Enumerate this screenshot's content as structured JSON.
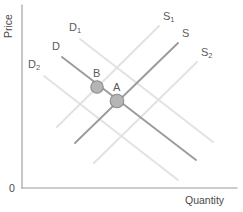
{
  "figure": {
    "background_color": "#ffffff"
  },
  "axes": {
    "y_axis_label": "Price",
    "x_axis_label": "Quantity",
    "origin_label": "0",
    "axis_color": "#9a9a9a",
    "ticks": [],
    "gridlines": false
  },
  "colors": {
    "primary_curve": "#9b9b9b",
    "shifted_curve": "#e2e2e2",
    "marker_fill": "#b5b5b5",
    "marker_stroke": "#8c8c8c",
    "label_text": "#5b5b5b",
    "axis_text": "#4a4a4a"
  },
  "curves": [
    {
      "id": "demand-original",
      "label_base": "D",
      "label_sub": "",
      "kind": "demand",
      "emphasis": "primary",
      "label_x": 52,
      "label_y": 50,
      "x1": 62,
      "y1": 57,
      "x2": 196,
      "y2": 160
    },
    {
      "id": "demand-shift-right",
      "label_base": "D",
      "label_sub": "1",
      "kind": "demand",
      "emphasis": "shifted",
      "label_x": 69,
      "label_y": 31,
      "x1": 80,
      "y1": 39,
      "x2": 213,
      "y2": 142
    },
    {
      "id": "demand-shift-left",
      "label_base": "D",
      "label_sub": "2",
      "kind": "demand",
      "emphasis": "shifted",
      "label_x": 28,
      "label_y": 68,
      "x1": 44,
      "y1": 76,
      "x2": 178,
      "y2": 180
    },
    {
      "id": "supply-original",
      "label_base": "S",
      "label_sub": "",
      "kind": "supply",
      "emphasis": "primary",
      "label_x": 182,
      "label_y": 37,
      "x1": 75,
      "y1": 143,
      "x2": 178,
      "y2": 43
    },
    {
      "id": "supply-shift-left",
      "label_base": "S",
      "label_sub": "1",
      "kind": "supply",
      "emphasis": "shifted",
      "label_x": 163,
      "label_y": 20,
      "x1": 57,
      "y1": 127,
      "x2": 159,
      "y2": 26
    },
    {
      "id": "supply-shift-right",
      "label_base": "S",
      "label_sub": "2",
      "kind": "supply",
      "emphasis": "shifted",
      "label_x": 201,
      "label_y": 56,
      "x1": 94,
      "y1": 163,
      "x2": 197,
      "y2": 62
    }
  ],
  "points": [
    {
      "id": "point-b",
      "label": "B",
      "x": 97,
      "y": 87,
      "radius": 6.2,
      "label_x": 93,
      "label_y": 77,
      "description": "Intersection of D and S1"
    },
    {
      "id": "point-a",
      "label": "A",
      "x": 117,
      "y": 101,
      "radius": 6.8,
      "label_x": 113,
      "label_y": 91,
      "description": "Intersection of D and S"
    }
  ],
  "chart_data": {
    "type": "line",
    "title": "",
    "xlabel": "Quantity",
    "ylabel": "Price",
    "grid": false,
    "legend": "inline-curve-labels",
    "series": [
      {
        "name": "D",
        "points": [
          [
            62,
            57
          ],
          [
            196,
            160
          ]
        ]
      },
      {
        "name": "D1",
        "points": [
          [
            80,
            39
          ],
          [
            213,
            142
          ]
        ]
      },
      {
        "name": "D2",
        "points": [
          [
            44,
            76
          ],
          [
            178,
            180
          ]
        ]
      },
      {
        "name": "S",
        "points": [
          [
            75,
            143
          ],
          [
            178,
            43
          ]
        ]
      },
      {
        "name": "S1",
        "points": [
          [
            57,
            127
          ],
          [
            159,
            26
          ]
        ]
      },
      {
        "name": "S2",
        "points": [
          [
            94,
            163
          ],
          [
            197,
            62
          ]
        ]
      }
    ],
    "annotations": [
      {
        "label": "A",
        "x": 117,
        "y": 101
      },
      {
        "label": "B",
        "x": 97,
        "y": 87
      }
    ]
  }
}
